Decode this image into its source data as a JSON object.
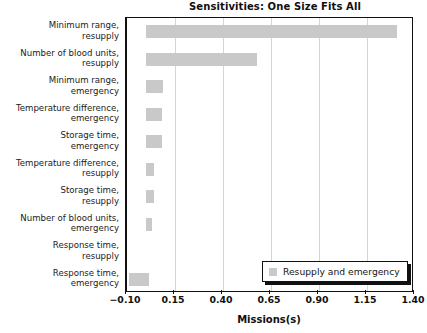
{
  "chart_data": {
    "type": "bar",
    "orientation": "horizontal",
    "title": "Sensitivities: One Size Fits All",
    "xlabel": "Missions(s)",
    "ylabel": "",
    "xlim": [
      -0.1,
      1.4
    ],
    "xticks": [
      "−0.10",
      "0.15",
      "0.40",
      "0.65",
      "0.90",
      "1.15",
      "1.40"
    ],
    "xtick_values": [
      -0.1,
      0.15,
      0.4,
      0.65,
      0.9,
      1.15,
      1.4
    ],
    "grid": "vertical",
    "legend_position": "lower right",
    "categories": [
      "Minimum range, resupply",
      "Number of blood units, resupply",
      "Minimum range, emergency",
      "Temperature difference, emergency",
      "Storage time, emergency",
      "Temperature difference, resupply",
      "Storage time, resupply",
      "Number of blood units, emergency",
      "Response time, resupply",
      "Response time, emergency"
    ],
    "series": [
      {
        "name": "Resupply and emergency",
        "color": "#c9c9c9",
        "bars": [
          {
            "label": "Minimum range, resupply",
            "start": 0.0,
            "end": 1.305
          },
          {
            "label": "Number of blood units, resupply",
            "start": 0.0,
            "end": 0.575
          },
          {
            "label": "Minimum range, emergency",
            "start": 0.0,
            "end": 0.09
          },
          {
            "label": "Temperature difference, emergency",
            "start": 0.0,
            "end": 0.085
          },
          {
            "label": "Storage time, emergency",
            "start": 0.0,
            "end": 0.085
          },
          {
            "label": "Temperature difference, resupply",
            "start": 0.0,
            "end": 0.042
          },
          {
            "label": "Storage time, resupply",
            "start": 0.0,
            "end": 0.042
          },
          {
            "label": "Number of blood units, emergency",
            "start": 0.0,
            "end": 0.03
          },
          {
            "label": "Response time, resupply",
            "start": 0.0,
            "end": 0.0
          },
          {
            "label": "Response time, emergency",
            "start": -0.09,
            "end": 0.015
          }
        ]
      }
    ]
  },
  "labels": {
    "rows": [
      {
        "line1": "Minimum range,",
        "line2": "resupply"
      },
      {
        "line1": "Number of blood units,",
        "line2": "resupply"
      },
      {
        "line1": "Minimum range,",
        "line2": "emergency"
      },
      {
        "line1": "Temperature difference,",
        "line2": "emergency"
      },
      {
        "line1": "Storage time,",
        "line2": "emergency"
      },
      {
        "line1": "Temperature difference,",
        "line2": "resupply"
      },
      {
        "line1": "Storage time,",
        "line2": "resupply"
      },
      {
        "line1": "Number of blood units,",
        "line2": "emergency"
      },
      {
        "line1": "Response time,",
        "line2": "resupply"
      },
      {
        "line1": "Response time,",
        "line2": "emergency"
      }
    ]
  },
  "legend": {
    "label": "Resupply and emergency",
    "swatch_color": "#c9c9c9"
  },
  "style": {
    "bar_color": "#c9c9c9",
    "grid_color": "#d4d4d4",
    "axis_color": "#111111",
    "background": "#ffffff"
  }
}
